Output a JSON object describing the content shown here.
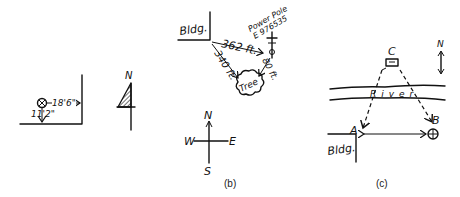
{
  "panel_a": {
    "label": "",
    "horizontal_distance": "18'6\"",
    "vertical_distance": "11'2\"",
    "north_label": "N"
  },
  "panel_b": {
    "label": "(b)",
    "building_label": "Bldg.",
    "pole_label": "Power Pole",
    "pole_id": "E 976535",
    "dist_bldg_to_pole": "362 ft.",
    "dist_bldg_to_tree": "340 ft.",
    "dist_pole_to_tree": "80 ft.",
    "tree_label": "Tree",
    "compass": {
      "n": "N",
      "s": "S",
      "e": "E",
      "w": "W"
    }
  },
  "panel_c": {
    "label": "(c)",
    "point_c": "C",
    "point_a": "A",
    "point_b": "B",
    "river_label": "River",
    "building_label": "Bldg.",
    "north_label": "N"
  }
}
